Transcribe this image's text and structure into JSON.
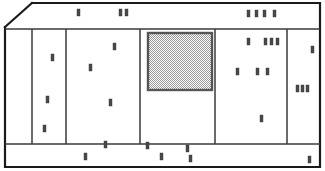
{
  "drawing": {
    "title": "Facade Elevation",
    "type": "architectural-elevation",
    "canvas": {
      "width": 325,
      "height": 171
    },
    "colors": {
      "background": "#ffffff",
      "outline": "#1a1a1a",
      "divider": "#3a3a3a",
      "mark_fill": "#4a4a4a",
      "window_fill": "#b4b4b4",
      "window_stroke": "#555555"
    },
    "outer_frame": {
      "label": "Outer Frame",
      "left": 5,
      "top": 3,
      "right": 320,
      "bottom": 167,
      "bevel_corner": "top-left",
      "bevel_from": {
        "x": 5,
        "y": 27
      },
      "bevel_to": {
        "x": 32,
        "y": 3
      }
    },
    "bands": {
      "top_band": {
        "label": "Top Band",
        "y_top": 3,
        "y_bottom": 29
      },
      "bottom_band": {
        "label": "Bottom Band",
        "y_top": 144,
        "y_bottom": 167
      },
      "mid_band": {
        "label": "Panel Row",
        "y_top": 29,
        "y_bottom": 144
      }
    },
    "panels": [
      {
        "id": "panel-1",
        "label": "Panel 1",
        "x": 32,
        "width": 34
      },
      {
        "id": "panel-2",
        "label": "Panel 2",
        "x": 66,
        "width": 74
      },
      {
        "id": "panel-3",
        "label": "Panel 3",
        "x": 140,
        "width": 75
      },
      {
        "id": "panel-4",
        "label": "Panel 4",
        "x": 215,
        "width": 72
      },
      {
        "id": "panel-5",
        "label": "Panel 5",
        "x": 287,
        "width": 33
      }
    ],
    "window": {
      "label": "Hatched Window",
      "x": 148,
      "y": 33,
      "width": 64,
      "height": 57,
      "fill_pattern": "checker-dither",
      "fill_color": "#b4b4b4"
    },
    "mark_size": {
      "width": 3,
      "height": 7
    },
    "marks": {
      "top_band": [
        {
          "x": 77,
          "y": 9
        },
        {
          "x": 119,
          "y": 9
        },
        {
          "x": 125,
          "y": 9
        },
        {
          "x": 247,
          "y": 10
        },
        {
          "x": 255,
          "y": 10
        },
        {
          "x": 263,
          "y": 10
        },
        {
          "x": 273,
          "y": 10
        }
      ],
      "panel_1": [
        {
          "x": 51,
          "y": 54
        },
        {
          "x": 46,
          "y": 96
        },
        {
          "x": 43,
          "y": 125
        }
      ],
      "panel_2": [
        {
          "x": 113,
          "y": 43
        },
        {
          "x": 89,
          "y": 64
        },
        {
          "x": 109,
          "y": 99
        }
      ],
      "panel_3": [],
      "panel_4": [
        {
          "x": 247,
          "y": 38
        },
        {
          "x": 264,
          "y": 38
        },
        {
          "x": 270,
          "y": 38
        },
        {
          "x": 276,
          "y": 38
        },
        {
          "x": 236,
          "y": 68
        },
        {
          "x": 256,
          "y": 68
        },
        {
          "x": 266,
          "y": 68
        },
        {
          "x": 260,
          "y": 115
        }
      ],
      "panel_5": [
        {
          "x": 311,
          "y": 46
        },
        {
          "x": 296,
          "y": 85
        },
        {
          "x": 301,
          "y": 85
        },
        {
          "x": 306,
          "y": 85
        }
      ],
      "bottom_band": [
        {
          "x": 104,
          "y": 141
        },
        {
          "x": 84,
          "y": 153
        },
        {
          "x": 146,
          "y": 142
        },
        {
          "x": 160,
          "y": 153
        },
        {
          "x": 186,
          "y": 145
        },
        {
          "x": 189,
          "y": 155
        },
        {
          "x": 308,
          "y": 156
        }
      ]
    }
  }
}
